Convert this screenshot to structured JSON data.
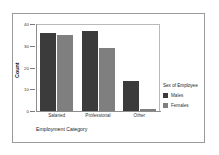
{
  "chart_data": {
    "type": "bar",
    "title": "",
    "categories": [
      "Salaried",
      "Professional",
      "Other"
    ],
    "series": [
      {
        "name": "Males",
        "values": [
          36,
          37,
          14
        ],
        "color": "#3b3b3b"
      },
      {
        "name": "Females",
        "values": [
          35,
          29,
          1
        ],
        "color": "#7f7f7f"
      }
    ],
    "xlabel": "Employment Category",
    "ylabel": "Count",
    "ylim": [
      0,
      40
    ],
    "yticks": [
      0,
      10,
      20,
      30,
      40
    ],
    "ytick_labels": [
      "0",
      "10",
      "20",
      "30",
      "40"
    ],
    "grid": false,
    "legend": {
      "title": "Sex of Employee",
      "position": "right",
      "entries": [
        {
          "label": "Males",
          "color": "#3b3b3b"
        },
        {
          "label": "Females",
          "color": "#7f7f7f"
        }
      ]
    }
  }
}
